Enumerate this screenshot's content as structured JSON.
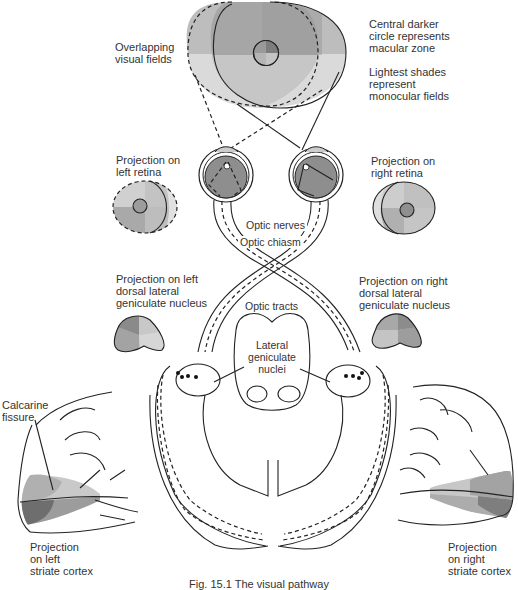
{
  "figure": {
    "caption": "Fig. 15.1 The visual pathway",
    "colors": {
      "darkest": "#7d7d7d",
      "dark": "#9a9a9a",
      "mid": "#b3b3b3",
      "light": "#cfcfcf",
      "lightest": "#e2e2e2",
      "line": "#222222"
    }
  },
  "labels": {
    "overlapping_fields": "Overlapping\nvisual fields",
    "central_circle": "Central darker\ncircle represents\nmacular zone",
    "lightest_shades": "Lightest shades\nrepresent\nmonocular fields",
    "left_retina": "Projection on\nleft retina",
    "right_retina": "Projection on\nright retina",
    "optic_nerves": "Optic nerves",
    "optic_chiasm": "Optic chiasm",
    "left_dlgn": "Projection on left\ndorsal lateral\ngeniculate nucleus",
    "right_dlgn": "Projection on right\ndorsal lateral\ngeniculate nucleus",
    "optic_tracts": "Optic tracts",
    "lateral_geniculate": "Lateral\ngeniculate\nnuclei",
    "calcarine": "Calcarine\nfissure",
    "left_cortex": "Projection\non left\nstriate cortex",
    "right_cortex": "Projection\non right\nstriate cortex"
  }
}
